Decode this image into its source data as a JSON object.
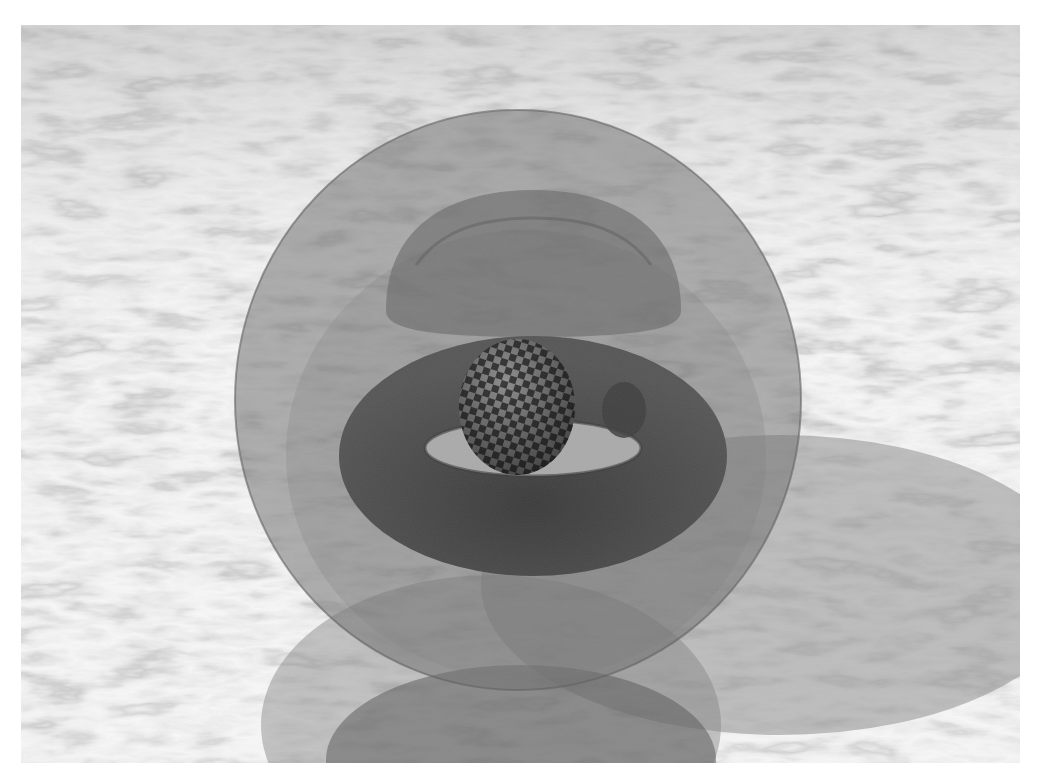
{
  "image": {
    "description": "Ray-traced scene: transparent glass sphere containing a torus and a checkered sphere, resting over a grey marble plane with reflections",
    "objects": [
      {
        "name": "outer-glass-sphere",
        "color": "#7a7a7a"
      },
      {
        "name": "inner-hemisphere",
        "color": "#6e6e6e"
      },
      {
        "name": "torus",
        "color": "#4a4a4a"
      },
      {
        "name": "checkered-sphere",
        "colors": [
          "#3a3a3a",
          "#8a8a8a"
        ]
      },
      {
        "name": "marble-floor",
        "colors": [
          "#d8d8d8",
          "#8c8c8c"
        ]
      }
    ],
    "palette": {
      "background": "#ffffff",
      "marble_light": "#dcdcdc",
      "marble_vein": "#8a8a8a",
      "glass": "#7c7c7c",
      "torus": "#474747",
      "shadow": "#9a9a9a"
    }
  }
}
